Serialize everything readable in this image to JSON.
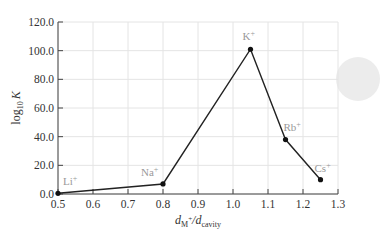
{
  "chart_data": {
    "type": "line",
    "title": "",
    "xlabel": "d_M+/d_cavity",
    "ylabel": "log10 K",
    "xlim": [
      0.5,
      1.3
    ],
    "ylim": [
      0,
      120
    ],
    "xticks": [
      "0.5",
      "0.6",
      "0.7",
      "0.8",
      "0.9",
      "1.0",
      "1.1",
      "1.2",
      "1.3"
    ],
    "yticks": [
      "0.0",
      "20.0",
      "40.0",
      "60.0",
      "80.0",
      "100.0",
      "120.0"
    ],
    "grid": true,
    "legend": null,
    "series": [
      {
        "name": "log10 K",
        "points": [
          {
            "label": "Li+",
            "x": 0.5,
            "y": 0.5
          },
          {
            "label": "Na+",
            "x": 0.8,
            "y": 7
          },
          {
            "label": "K+",
            "x": 1.05,
            "y": 101
          },
          {
            "label": "Rb+",
            "x": 1.15,
            "y": 38
          },
          {
            "label": "Cs+",
            "x": 1.25,
            "y": 10
          }
        ]
      }
    ]
  },
  "axes": {
    "x_title_main": "d",
    "x_title_sub1": "M",
    "x_title_sup": "+",
    "x_title_mid": "/d",
    "x_title_sub2": "cavity",
    "y_title_main": "log",
    "y_title_sub": "10",
    "y_title_var": "K"
  }
}
